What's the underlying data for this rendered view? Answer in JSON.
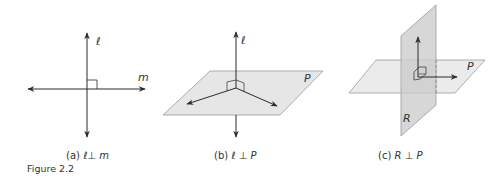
{
  "figure": {
    "label": "Figure 2.2",
    "panels": [
      {
        "id": "a",
        "caption_prefix": "(a)",
        "caption_lhs": "ℓ",
        "caption_op": "⊥",
        "caption_rhs": "m",
        "labels": {
          "line_l": "ℓ",
          "line_m": "m"
        }
      },
      {
        "id": "b",
        "caption_prefix": "(b)",
        "caption_lhs": "ℓ",
        "caption_op": "⊥",
        "caption_rhs": "P",
        "labels": {
          "line_l": "ℓ",
          "plane_p": "P"
        }
      },
      {
        "id": "c",
        "caption_prefix": "(c)",
        "caption_lhs": "R",
        "caption_op": "⊥",
        "caption_rhs": "P",
        "labels": {
          "plane_p": "P",
          "plane_r": "R"
        }
      }
    ],
    "colors": {
      "line": "#2b2b2b",
      "plane_p": "#e6e6e6",
      "plane_r": "#c9c9c9",
      "plane_edge": "#9a9a9a",
      "text": "#333333"
    }
  }
}
